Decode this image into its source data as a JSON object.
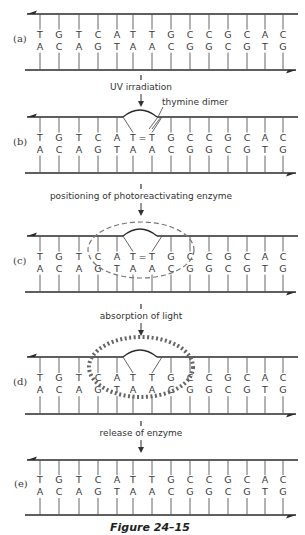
{
  "figure": {
    "caption": "Figure 24–15",
    "top_strand": [
      "T",
      "G",
      "T",
      "C",
      "A",
      "T",
      "T",
      "G",
      "C",
      "C",
      "G",
      "C",
      "A",
      "C"
    ],
    "bottom_strand": [
      "A",
      "C",
      "A",
      "G",
      "T",
      "A",
      "A",
      "C",
      "G",
      "G",
      "C",
      "G",
      "T",
      "G"
    ],
    "panels": [
      {
        "label": "(a)",
        "state": "normal",
        "top_y": 14,
        "bottom_y": 70
      },
      {
        "label": "(b)",
        "state": "dimer",
        "top_y": 117,
        "bottom_y": 173
      },
      {
        "label": "(c)",
        "state": "enzyme-bound",
        "top_y": 236,
        "bottom_y": 292
      },
      {
        "label": "(d)",
        "state": "light-absorbed",
        "top_y": 357,
        "bottom_y": 414
      },
      {
        "label": "(e)",
        "state": "repaired",
        "top_y": 460,
        "bottom_y": 515
      }
    ],
    "steps": [
      {
        "label": "UV irradiation",
        "y": 87
      },
      {
        "label": "positioning of photoreactivating enzyme",
        "y": 196
      },
      {
        "label": "absorption of light",
        "y": 316
      },
      {
        "label": "release of enzyme",
        "y": 433
      }
    ],
    "annotations": {
      "thymine_dimer": "thymine dimer",
      "dimer_bond": "="
    },
    "colors": {
      "ink": "#2a2a2a",
      "enzyme": "#777777",
      "background": "#ffffff"
    }
  }
}
